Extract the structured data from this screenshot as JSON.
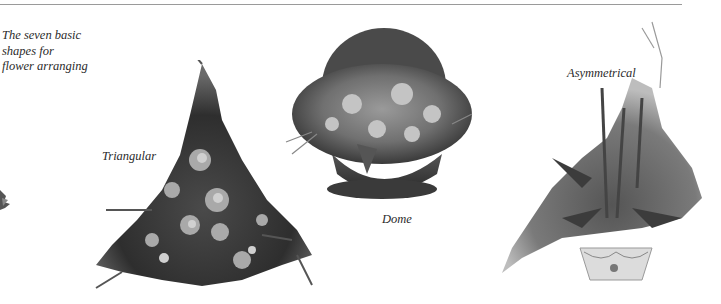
{
  "page": {
    "intro_caption": "The seven basic shapes for flower arranging",
    "intro_lines": [
      "The seven basic",
      "shapes for",
      "flower arranging"
    ]
  },
  "arrangements": [
    {
      "id": "partial-left",
      "caption": ""
    },
    {
      "id": "triangular",
      "caption": "Triangular"
    },
    {
      "id": "dome",
      "caption": "Dome"
    },
    {
      "id": "asymmetrical",
      "caption": "Asymmetrical"
    }
  ],
  "colors": {
    "rule": "#9a9a9a",
    "text": "#2b2b2b",
    "background": "#ffffff"
  }
}
